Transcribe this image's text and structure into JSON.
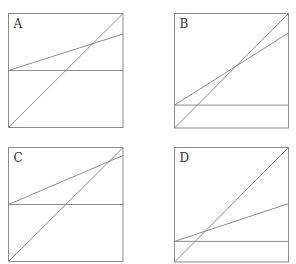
{
  "chart_data": [
    {
      "type": "line",
      "title": "A",
      "xlim": [
        0,
        1
      ],
      "ylim": [
        0,
        1
      ],
      "grid": false,
      "series": [
        {
          "name": "diagonal",
          "x": [
            0,
            1
          ],
          "y": [
            0,
            1
          ]
        },
        {
          "name": "slanted",
          "x": [
            0,
            1
          ],
          "y": [
            0.5,
            0.82
          ]
        },
        {
          "name": "horizontal",
          "x": [
            0,
            1
          ],
          "y": [
            0.5,
            0.5
          ]
        }
      ]
    },
    {
      "type": "line",
      "title": "B",
      "xlim": [
        0,
        1
      ],
      "ylim": [
        0,
        1
      ],
      "grid": false,
      "series": [
        {
          "name": "diagonal",
          "x": [
            0,
            1
          ],
          "y": [
            0,
            1
          ]
        },
        {
          "name": "slanted",
          "x": [
            0,
            1
          ],
          "y": [
            0.2,
            0.83
          ]
        },
        {
          "name": "horizontal",
          "x": [
            0,
            1
          ],
          "y": [
            0.2,
            0.2
          ]
        }
      ]
    },
    {
      "type": "line",
      "title": "C",
      "xlim": [
        0,
        1
      ],
      "ylim": [
        0,
        1
      ],
      "grid": false,
      "series": [
        {
          "name": "diagonal",
          "x": [
            0,
            1
          ],
          "y": [
            0,
            1
          ]
        },
        {
          "name": "slanted",
          "x": [
            0,
            1
          ],
          "y": [
            0.5,
            0.93
          ]
        },
        {
          "name": "horizontal",
          "x": [
            0,
            1
          ],
          "y": [
            0.5,
            0.5
          ]
        }
      ]
    },
    {
      "type": "line",
      "title": "D",
      "xlim": [
        0,
        1
      ],
      "ylim": [
        0,
        1
      ],
      "grid": false,
      "series": [
        {
          "name": "diagonal",
          "x": [
            0,
            1
          ],
          "y": [
            0,
            1
          ]
        },
        {
          "name": "slanted",
          "x": [
            0,
            1
          ],
          "y": [
            0.18,
            0.51
          ]
        },
        {
          "name": "horizontal",
          "x": [
            0,
            1
          ],
          "y": [
            0.18,
            0.18
          ]
        }
      ]
    }
  ],
  "colors": {
    "line": "#8c8c8c",
    "frame": "#8c8c8c",
    "label": "#333333"
  }
}
